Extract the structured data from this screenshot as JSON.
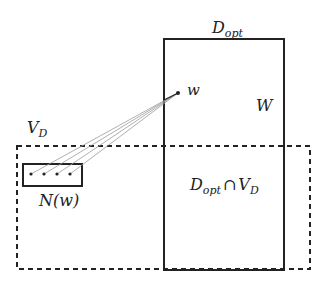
{
  "diagram": {
    "labels": {
      "d_opt": "D",
      "d_opt_sub": "opt",
      "w": "w",
      "W": "W",
      "v_d": "V",
      "v_d_sub": "D",
      "n_w": "N(w)",
      "intersection_d": "D",
      "intersection_sub": "opt",
      "intersection_cap": "∩",
      "intersection_v": "V",
      "intersection_v_sub": "D"
    },
    "shapes": {
      "d_opt_rect": {
        "x": 164,
        "y": 39,
        "w": 120,
        "h": 231,
        "style": "solid"
      },
      "v_d_rect": {
        "x": 17,
        "y": 146,
        "w": 293,
        "h": 123,
        "style": "dashed"
      },
      "n_w_rect": {
        "x": 23,
        "y": 164,
        "w": 59,
        "h": 22,
        "style": "solid"
      },
      "w_point": {
        "x": 178,
        "y": 93
      },
      "neighbor_points": [
        {
          "x": 31,
          "y": 174
        },
        {
          "x": 44,
          "y": 174
        },
        {
          "x": 57,
          "y": 174
        },
        {
          "x": 70,
          "y": 174
        }
      ]
    },
    "colors": {
      "stroke": "#222222",
      "edge": "#9a9a9a"
    }
  }
}
